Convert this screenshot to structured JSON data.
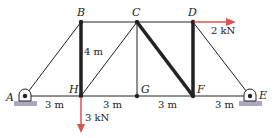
{
  "diagram": {
    "type": "truss",
    "nodes": {
      "A": {
        "label": "A",
        "x": 25,
        "y": 96
      },
      "H": {
        "label": "H",
        "x": 81,
        "y": 96
      },
      "G": {
        "label": "G",
        "x": 137,
        "y": 96
      },
      "F": {
        "label": "F",
        "x": 193,
        "y": 96
      },
      "E": {
        "label": "E",
        "x": 250,
        "y": 96
      },
      "B": {
        "label": "B",
        "x": 81,
        "y": 22
      },
      "C": {
        "label": "C",
        "x": 137,
        "y": 22
      },
      "D": {
        "label": "D",
        "x": 193,
        "y": 22
      }
    },
    "members_thin": [
      "AB",
      "BC",
      "CD",
      "CH",
      "CG",
      "DE",
      "AH",
      "HG",
      "GF",
      "FE"
    ],
    "members_thick": [
      "BH",
      "CF",
      "DF"
    ],
    "dimensions": {
      "height": "4 m",
      "span_AH": "3 m",
      "span_HG": "3 m",
      "span_GF": "3 m",
      "span_FE": "3 m"
    },
    "loads": {
      "H": {
        "label": "3 kN",
        "direction": "down"
      },
      "D": {
        "label": "2 kN",
        "direction": "right"
      }
    },
    "supports": {
      "A": "pin",
      "E": "pin"
    },
    "colors": {
      "member": "#222222",
      "load": "#d9534f",
      "ground": "#a9a9bf"
    }
  }
}
